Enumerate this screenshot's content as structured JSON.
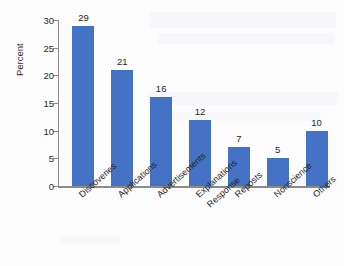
{
  "figure": {
    "background_color": "#fcfcfc",
    "bar_color": "#4472c4",
    "axis_color": "#8b8b8b"
  },
  "chart_data": {
    "type": "bar",
    "title": "",
    "subtitle": "",
    "xlabel": "",
    "ylabel": "Percent",
    "ylim": [
      0,
      30
    ],
    "yticks": [
      0,
      5,
      10,
      15,
      20,
      25,
      30
    ],
    "ytick_labels": [
      "0",
      "5",
      "10",
      "15",
      "20",
      "25",
      "30"
    ],
    "grid": false,
    "legend": false,
    "legend_position": "none",
    "value_labels_shown": true,
    "xtick_label_rotation": -42,
    "categories": [
      "Discoveries",
      "Applications",
      "Advertisements",
      "Explanations",
      "Reposts",
      "Nonscience",
      "Others"
    ],
    "category_sublabels": [
      "",
      "",
      "",
      "Response",
      "",
      "",
      ""
    ],
    "values": [
      29,
      21,
      16,
      12,
      7,
      5,
      10
    ],
    "value_label_texts": [
      "29",
      "21",
      "16",
      "12",
      "7",
      "5",
      "10"
    ],
    "series": [
      {
        "name": "Percent",
        "color": "#4472c4",
        "values": [
          29,
          21,
          16,
          12,
          7,
          5,
          10
        ]
      }
    ]
  }
}
